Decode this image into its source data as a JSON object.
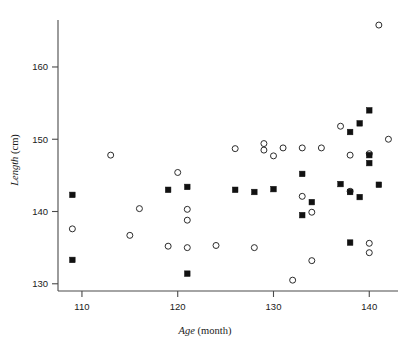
{
  "chart_data": {
    "type": "scatter",
    "title": "",
    "xlabel": "Age (month)",
    "xlabel_italic_part": "Age",
    "xlabel_rest": " (month)",
    "ylabel": "Length (cm)",
    "ylabel_italic_part": "Length",
    "ylabel_rest": " (cm)",
    "xlim": [
      107.5,
      143.0
    ],
    "ylim": [
      129.0,
      166.5
    ],
    "xticks": [
      110,
      120,
      130,
      140
    ],
    "yticks": [
      130,
      140,
      150,
      160
    ],
    "xtick_labels": [
      "110",
      "120",
      "130",
      "140"
    ],
    "ytick_labels": [
      "130",
      "140",
      "150",
      "160"
    ],
    "grid": false,
    "legend": null,
    "marker_colors": {
      "open_circle_stroke": "#2b2b2b",
      "filled_square_fill": "#111111",
      "axis": "#4a4a4a"
    },
    "series": [
      {
        "name": "open-circle",
        "marker": "open-circle",
        "points": [
          [
            109.0,
            137.6
          ],
          [
            113.0,
            147.8
          ],
          [
            115.0,
            136.7
          ],
          [
            116.0,
            140.4
          ],
          [
            119.0,
            135.2
          ],
          [
            120.0,
            145.4
          ],
          [
            121.0,
            140.3
          ],
          [
            121.0,
            138.8
          ],
          [
            121.0,
            135.0
          ],
          [
            124.0,
            135.3
          ],
          [
            126.0,
            148.7
          ],
          [
            128.0,
            135.0
          ],
          [
            129.0,
            149.4
          ],
          [
            129.0,
            148.5
          ],
          [
            130.0,
            147.7
          ],
          [
            131.0,
            148.8
          ],
          [
            132.0,
            130.5
          ],
          [
            133.0,
            148.8
          ],
          [
            133.0,
            142.1
          ],
          [
            134.0,
            133.2
          ],
          [
            134.0,
            139.9
          ],
          [
            135.0,
            148.8
          ],
          [
            137.0,
            151.8
          ],
          [
            138.0,
            147.8
          ],
          [
            138.0,
            142.8
          ],
          [
            140.0,
            148.0
          ],
          [
            140.0,
            135.6
          ],
          [
            140.0,
            134.3
          ],
          [
            141.0,
            165.8
          ],
          [
            142.0,
            150.0
          ]
        ]
      },
      {
        "name": "filled-square",
        "marker": "filled-square",
        "points": [
          [
            109.0,
            142.3
          ],
          [
            109.0,
            133.3
          ],
          [
            119.0,
            143.0
          ],
          [
            121.0,
            143.4
          ],
          [
            121.0,
            131.4
          ],
          [
            126.0,
            143.0
          ],
          [
            128.0,
            142.7
          ],
          [
            130.0,
            143.1
          ],
          [
            133.0,
            145.2
          ],
          [
            133.0,
            139.5
          ],
          [
            134.0,
            141.3
          ],
          [
            137.0,
            143.8
          ],
          [
            138.0,
            151.0
          ],
          [
            138.0,
            142.7
          ],
          [
            138.0,
            135.7
          ],
          [
            139.0,
            152.2
          ],
          [
            139.0,
            142.0
          ],
          [
            140.0,
            154.0
          ],
          [
            140.0,
            147.8
          ],
          [
            140.0,
            146.7
          ],
          [
            141.0,
            143.7
          ]
        ]
      }
    ]
  },
  "axes": {
    "x_tick_text": [
      "110",
      "120",
      "130",
      "140"
    ],
    "y_tick_text": [
      "130",
      "140",
      "150",
      "160"
    ]
  }
}
